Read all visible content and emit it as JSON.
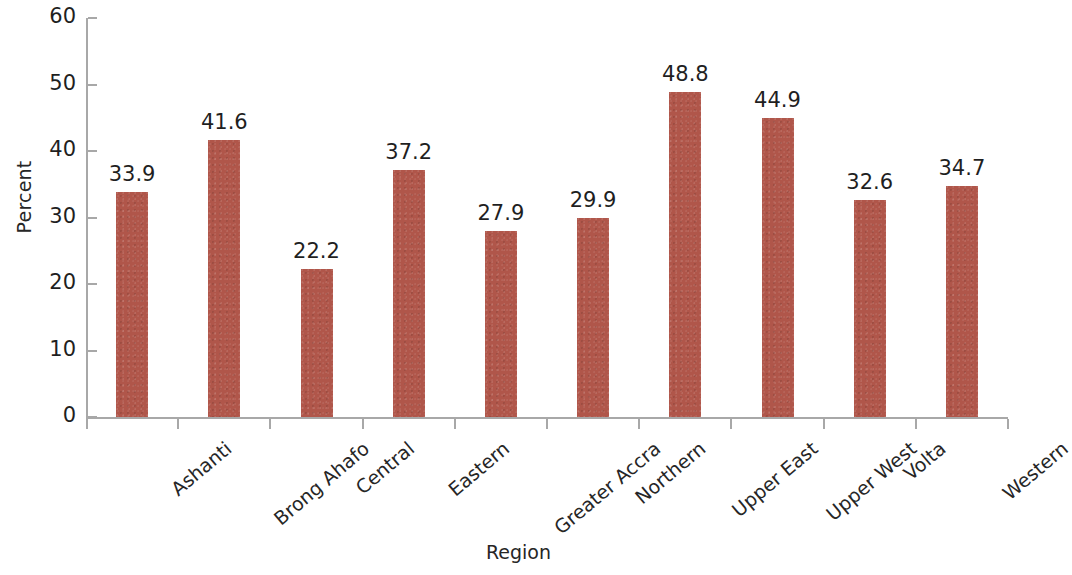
{
  "chart_data": {
    "type": "bar",
    "title": "",
    "subtitle": "",
    "xlabel": "Region",
    "ylabel": "Percent",
    "categories": [
      "Ashanti",
      "Brong Ahafo",
      "Central",
      "Eastern",
      "Greater Accra",
      "Northern",
      "Upper East",
      "Upper West",
      "Volta",
      "Western"
    ],
    "values": [
      33.9,
      41.6,
      22.2,
      37.2,
      27.9,
      29.9,
      48.8,
      44.9,
      32.6,
      34.7
    ],
    "value_labels": [
      "33.9",
      "41.6",
      "22.2",
      "37.2",
      "27.9",
      "29.9",
      "48.8",
      "44.9",
      "32.6",
      "34.7"
    ],
    "ylim": [
      0,
      60
    ],
    "y_ticks": [
      0,
      10,
      20,
      30,
      40,
      50,
      60
    ],
    "y_tick_labels": [
      "0",
      "10",
      "20",
      "30",
      "40",
      "50",
      "60"
    ],
    "grid": false,
    "legend": null,
    "legend_position": "none",
    "bar_color": "#b0564a",
    "axis_color": "#a8a8a8",
    "text_color": "#1f1f1f",
    "background": "#ffffff",
    "x_tick_label_rotation": -40
  }
}
